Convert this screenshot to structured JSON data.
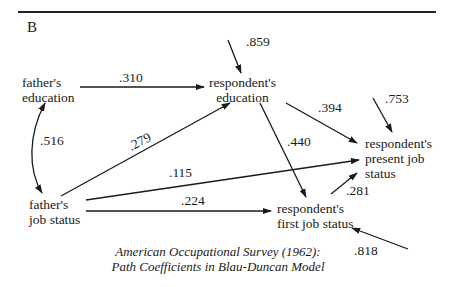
{
  "panel_label": "B",
  "nodes": {
    "fathers_education": [
      "father's",
      "education"
    ],
    "fathers_job_status": [
      "father's",
      "job status"
    ],
    "respondents_education": [
      "respondent's",
      "education"
    ],
    "respondents_first_job_status": [
      "respondent's",
      "first job status"
    ],
    "respondents_present_job_status": [
      "respondent's",
      "present job",
      "status"
    ]
  },
  "paths": [
    {
      "from": "father's education",
      "to": "respondent's education",
      "coefficient": ".310"
    },
    {
      "from": "father's education",
      "to": "father's job status",
      "coefficient": ".516",
      "type": "correlation"
    },
    {
      "from": "father's job status",
      "to": "respondent's education",
      "coefficient": ".279"
    },
    {
      "from": "father's job status",
      "to": "respondent's present job status",
      "coefficient": ".115"
    },
    {
      "from": "father's job status",
      "to": "respondent's first job status",
      "coefficient": ".224"
    },
    {
      "from": "respondent's education",
      "to": "respondent's first job status",
      "coefficient": ".440"
    },
    {
      "from": "respondent's education",
      "to": "respondent's present job status",
      "coefficient": ".394"
    },
    {
      "from": "respondent's first job status",
      "to": "respondent's present job status",
      "coefficient": ".281"
    },
    {
      "from": "residual",
      "to": "respondent's education",
      "coefficient": ".859"
    },
    {
      "from": "residual",
      "to": "respondent's present job status",
      "coefficient": ".753"
    },
    {
      "from": "residual",
      "to": "respondent's first job status",
      "coefficient": ".818"
    }
  ],
  "coefficients": {
    "fe_re": ".310",
    "fe_fj": ".516",
    "fj_re": ".279",
    "fj_rp": ".115",
    "fj_rf": ".224",
    "re_rf": ".440",
    "re_rp": ".394",
    "rf_rp": ".281",
    "res_re": ".859",
    "res_rp": ".753",
    "res_rf": ".818"
  },
  "caption": {
    "line1": "American Occupational Survey (1962):",
    "line2": "Path Coefficients in Blau-Duncan Model"
  }
}
